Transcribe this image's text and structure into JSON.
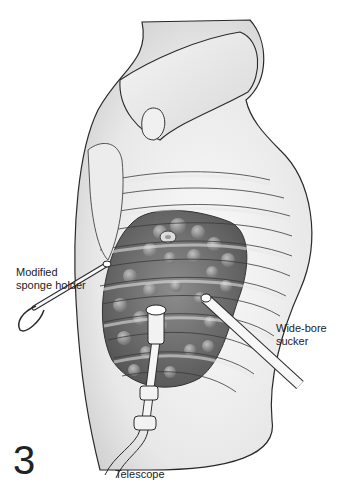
{
  "figure": {
    "number": "3",
    "labels": {
      "sponge_holder": "Modified sponge holder",
      "sucker": "Wide-bore sucker",
      "telescope": "Telescope"
    }
  },
  "colors": {
    "background": "#ffffff",
    "skin": "#eeeeee",
    "skin_shadow": "#d4d4d4",
    "outline": "#2a2a2a",
    "lung": "#6f6f6f",
    "lung_highlight": "#a6a6a6",
    "rib": "#e4e4e4"
  }
}
